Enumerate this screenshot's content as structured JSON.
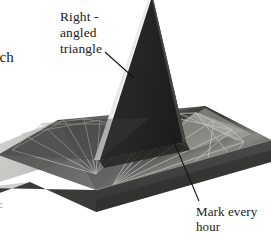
{
  "figure": {
    "background_color": "#ffffff",
    "ink_color": "#1a1a1a"
  },
  "labels": {
    "left_cropped_text": "he\na\neach\ne",
    "gnomon": "Right -\nangled\ntriangle",
    "hour_marks": "Mark every\nhour",
    "stray_edge_glyph": "c"
  },
  "object": {
    "base_top_color": "#5a5a5a",
    "base_top_shadow_color": "#3a3a3a",
    "base_rim_color": "#c9c9c4",
    "base_front_color": "#3e3e3e",
    "base_side_color": "#2e2e2e",
    "gnomon_face_color": "#2a2a2a",
    "gnomon_edge_highlight": "#e6e6e2",
    "hour_line_color": "#b9b9b4",
    "left_dial_color": "#4a4a4a"
  },
  "leaders": {
    "gnomon_leader": {
      "x1": 105,
      "y1": 52,
      "x2": 134,
      "y2": 78
    },
    "hour_leader": {
      "x1": 173,
      "y1": 140,
      "x2": 198,
      "y2": 200
    }
  }
}
